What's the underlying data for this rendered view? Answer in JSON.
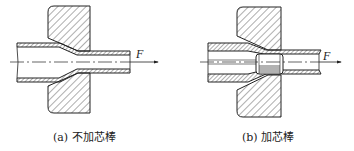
{
  "figure": {
    "panels": [
      {
        "id": "a",
        "caption": "(a) 不加芯棒",
        "force_label": "F",
        "mandrel": false
      },
      {
        "id": "b",
        "caption": "(b) 加芯棒",
        "force_label": "F",
        "mandrel": true
      }
    ],
    "colors": {
      "line": "#222222",
      "hatch": "#333333",
      "background": "#ffffff"
    }
  }
}
